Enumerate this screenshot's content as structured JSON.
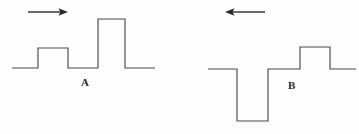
{
  "figure": {
    "width": 359,
    "height": 134,
    "background_color": "#fdfdfd",
    "line_color": "#4a4a4a",
    "arrow_color": "#2a2a2a",
    "label_color": "#2b2b2b"
  },
  "panels": [
    {
      "id": "panel-a",
      "label": "A",
      "label_x": 81,
      "label_y": 77,
      "direction_arrow": {
        "name": "right-arrow",
        "points": "right",
        "x_start": 28,
        "x_end": 68,
        "y": 12
      },
      "waveform": {
        "name": "waveform-a",
        "baseline_y": 68,
        "x_start": 12,
        "x_end": 155,
        "pulses": [
          {
            "type": "up",
            "x_left": 38,
            "x_right": 68,
            "level_y": 48,
            "height": 20
          },
          {
            "type": "up",
            "x_left": 98,
            "x_right": 125,
            "level_y": 19,
            "height": 49
          }
        ],
        "path": "M 12,68 L 38,68 L 38,48 L 68,48 L 68,68 L 98,68 L 98,19 L 125,19 L 125,68 L 155,68"
      }
    },
    {
      "id": "panel-b",
      "label": "B",
      "label_x": 288,
      "label_y": 80,
      "direction_arrow": {
        "name": "left-arrow",
        "points": "left",
        "x_start": 265,
        "x_end": 225,
        "y": 12
      },
      "waveform": {
        "name": "waveform-b",
        "baseline_y": 69,
        "x_start": 208,
        "x_end": 356,
        "pulses": [
          {
            "type": "down",
            "x_left": 237,
            "x_right": 268,
            "level_y": 121,
            "height": -52
          },
          {
            "type": "up",
            "x_left": 300,
            "x_right": 330,
            "level_y": 47,
            "height": 22
          }
        ],
        "path": "M 208,69 L 237,69 L 237,121 L 268,121 L 268,69 L 300,69 L 300,47 L 330,47 L 330,69 L 356,69"
      }
    }
  ]
}
